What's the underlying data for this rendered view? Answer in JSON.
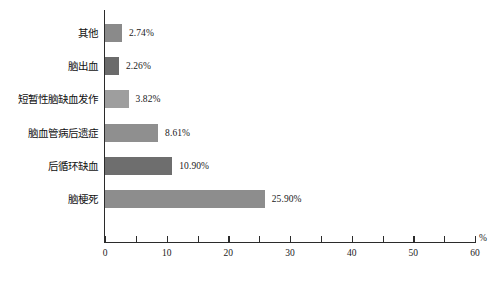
{
  "chart_data": {
    "type": "bar",
    "orientation": "horizontal",
    "title": "",
    "subtitle": "",
    "xlabel": "%",
    "ylabel": "",
    "xlim": [
      0,
      60
    ],
    "ylim": null,
    "grid": false,
    "legend": null,
    "x_major_ticks": [
      "0",
      "10",
      "20",
      "30",
      "40",
      "50",
      "60"
    ],
    "x_major_values": [
      0,
      10,
      20,
      30,
      40,
      50,
      60
    ],
    "x_minor_values": [
      5,
      15,
      25,
      35,
      45,
      55
    ],
    "categories": [
      "其他",
      "脑出血",
      "短暂性脑缺血发作",
      "脑血管病后遗症",
      "后循环缺血",
      "脑梗死"
    ],
    "values": [
      2.74,
      2.26,
      3.82,
      8.61,
      10.9,
      25.9
    ],
    "data_labels": [
      "2.74%",
      "2.26%",
      "3.82%",
      "8.61%",
      "10.90%",
      "25.90%"
    ],
    "bar_colors": [
      "#8a8a8a",
      "#6b6b6b",
      "#9e9e9e",
      "#8f8f8f",
      "#6e6e6e",
      "#8d8d8d"
    ],
    "axis_color": "#2b2b2b",
    "background_color": "#ffffff",
    "text_color": "#1a1a1a"
  }
}
